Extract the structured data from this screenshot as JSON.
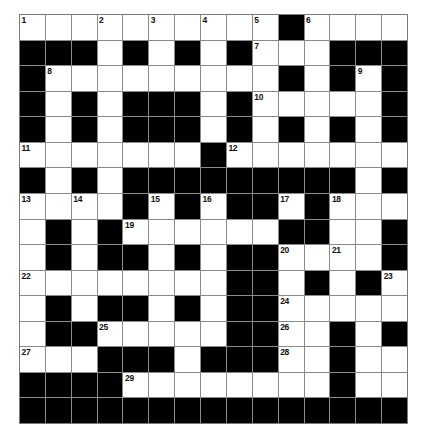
{
  "puzzle": {
    "title": "Crossword Grid",
    "type": "crossword",
    "rows": 16,
    "cols": 15,
    "colors": {
      "block": "#000000",
      "open": "#ffffff",
      "gridline": "#8a8a8a",
      "number": "#111111",
      "background": "#ffffff"
    },
    "max_clue_number": 30,
    "grid": [
      "OOOOOOOOOOXOOOO",
      "XXXOXOXOXOOOXXX",
      "XOOOOOOOOOXOXOX",
      "XOXOXXXOXOOOOOX",
      "XOXOXXXOXOXOXOX",
      "OOOOOOOXOOOOOOO",
      "XOXOXXXXXXXXXOX",
      "OOOOXOXOXXOXOOO",
      "OXOXOOOOOOXXOOX",
      "OXOXXOXOXXOOOOX",
      "OOOOOOOOXXOXOXO",
      "OXOXXOXOXXOOOOO",
      "OXXOOOOOXXOOXOX",
      "OOOXXXOXXXOOXOO",
      "XXXXOOOOOOOOXOO",
      "XXXXXXXXXXXXXXX"
    ],
    "numbers": [
      {
        "n": 1,
        "row": 0,
        "col": 0
      },
      {
        "n": 2,
        "row": 0,
        "col": 3
      },
      {
        "n": 3,
        "row": 0,
        "col": 5
      },
      {
        "n": 4,
        "row": 0,
        "col": 7
      },
      {
        "n": 5,
        "row": 0,
        "col": 9
      },
      {
        "n": 6,
        "row": 0,
        "col": 11
      },
      {
        "n": 7,
        "row": 1,
        "col": 9
      },
      {
        "n": 8,
        "row": 2,
        "col": 1
      },
      {
        "n": 9,
        "row": 2,
        "col": 13
      },
      {
        "n": 10,
        "row": 3,
        "col": 9
      },
      {
        "n": 11,
        "row": 5,
        "col": 0
      },
      {
        "n": 12,
        "row": 5,
        "col": 8
      },
      {
        "n": 13,
        "row": 7,
        "col": 0
      },
      {
        "n": 14,
        "row": 7,
        "col": 2
      },
      {
        "n": 15,
        "row": 7,
        "col": 5
      },
      {
        "n": 16,
        "row": 7,
        "col": 7
      },
      {
        "n": 17,
        "row": 7,
        "col": 10
      },
      {
        "n": 18,
        "row": 7,
        "col": 12
      },
      {
        "n": 19,
        "row": 8,
        "col": 4
      },
      {
        "n": 20,
        "row": 9,
        "col": 10
      },
      {
        "n": 21,
        "row": 9,
        "col": 12
      },
      {
        "n": 22,
        "row": 10,
        "col": 0
      },
      {
        "n": 23,
        "row": 10,
        "col": 14
      },
      {
        "n": 24,
        "row": 11,
        "col": 10
      },
      {
        "n": 25,
        "row": 12,
        "col": 3
      },
      {
        "n": 26,
        "row": 12,
        "col": 10
      },
      {
        "n": 27,
        "row": 13,
        "col": 0
      },
      {
        "n": 28,
        "row": 13,
        "col": 10
      },
      {
        "n": 29,
        "row": 14,
        "col": 4
      },
      {
        "n": 30,
        "row": 14,
        "col": 12
      }
    ]
  }
}
